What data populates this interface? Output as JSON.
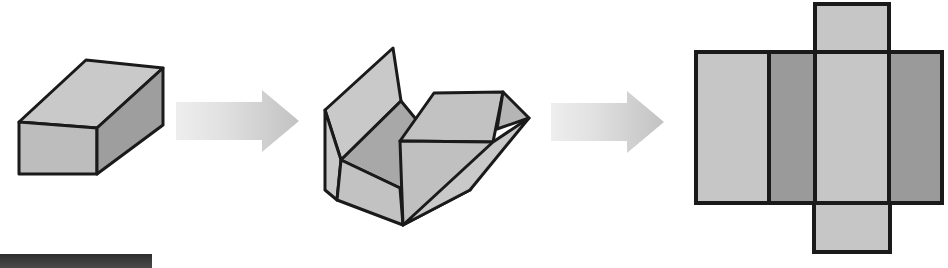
{
  "figure": {
    "title": "Unfolding a rectangular box into its net",
    "caption": "",
    "background_color": "#ffffff",
    "outline_color": "#1a1a1a",
    "panels": [
      {
        "id": "solid-box",
        "label": "3D rectangular box (solid)",
        "faces": [
          {
            "name": "top-face",
            "fill": "#c9c9c9"
          },
          {
            "name": "front-face",
            "fill": "#bdbdbd"
          },
          {
            "name": "right-side-face",
            "fill": "#9e9e9e"
          }
        ]
      },
      {
        "id": "unfolding-box",
        "label": "Box partially unfolded, flaps opening",
        "faces": [
          {
            "name": "left-back-flap",
            "fill": "#c9c9c9"
          },
          {
            "name": "inner-left-face",
            "fill": "#a8a8a8"
          },
          {
            "name": "bottom-front-face",
            "fill": "#c2c2c2"
          },
          {
            "name": "rear-right-flap",
            "fill": "#c2c2c2"
          },
          {
            "name": "right-wing-flap",
            "fill": "#c9c9c9"
          },
          {
            "name": "thin-edge-sliver",
            "fill": "#b5b5b5"
          }
        ]
      },
      {
        "id": "flat-net",
        "label": "Flat net of the box (six rectangles)",
        "faces": [
          {
            "name": "net-panel-1",
            "fill": "#c6c6c6"
          },
          {
            "name": "net-panel-2",
            "fill": "#9a9a9a"
          },
          {
            "name": "net-panel-3",
            "fill": "#c6c6c6"
          },
          {
            "name": "net-panel-4",
            "fill": "#9a9a9a"
          },
          {
            "name": "net-top-flap",
            "fill": "#c6c6c6"
          },
          {
            "name": "net-bottom-flap",
            "fill": "#c6c6c6"
          }
        ]
      }
    ],
    "arrows": [
      {
        "name": "arrow-step-1",
        "direction": "right",
        "gradient_from": "#ededed",
        "gradient_to": "#c4c4c4"
      },
      {
        "name": "arrow-step-2",
        "direction": "right",
        "gradient_from": "#ededed",
        "gradient_to": "#c4c4c4"
      }
    ],
    "footer_bar": {
      "name": "bottom-left-bar",
      "fill": "#3d3d3d"
    }
  }
}
